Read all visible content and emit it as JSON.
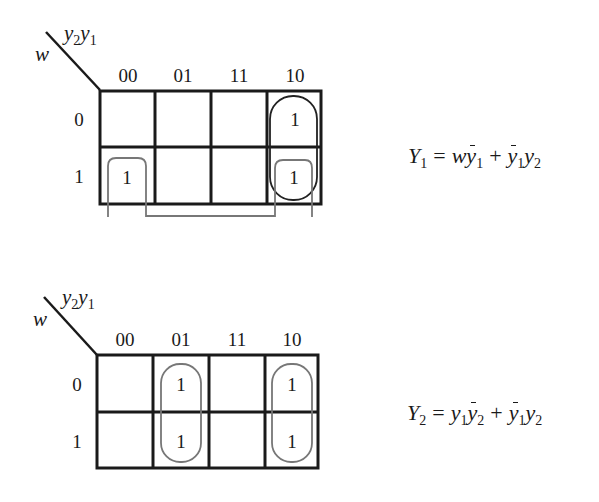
{
  "kmaps": [
    {
      "id": "Y1",
      "col_var_label": "y2y1",
      "row_var_label": "w",
      "col_headers": [
        "00",
        "01",
        "11",
        "10"
      ],
      "row_headers": [
        "0",
        "1"
      ],
      "cells": [
        [
          "",
          "",
          "",
          "1"
        ],
        [
          "1",
          "",
          "",
          "1"
        ]
      ],
      "groups": [
        {
          "name": "w-ybar1 (wraparound: w=1, cols 00 & 10)",
          "color": "#777777"
        },
        {
          "name": "ybar1-y2 (col 10, both rows)",
          "color": "#222222"
        }
      ],
      "equation": {
        "lhs": "Y",
        "lhs_sub": "1",
        "rhs_text": "w ȳ1 + ȳ1 y2",
        "terms": [
          {
            "parts": [
              {
                "v": "w"
              },
              {
                "v": "y",
                "bar": true,
                "sub": "1"
              }
            ]
          },
          {
            "parts": [
              {
                "v": "y",
                "bar": true,
                "sub": "1"
              },
              {
                "v": "y",
                "sub": "2"
              }
            ]
          }
        ]
      }
    },
    {
      "id": "Y2",
      "col_var_label": "y2y1",
      "row_var_label": "w",
      "col_headers": [
        "00",
        "01",
        "11",
        "10"
      ],
      "row_headers": [
        "0",
        "1"
      ],
      "cells": [
        [
          "",
          "1",
          "",
          "1"
        ],
        [
          "",
          "1",
          "",
          "1"
        ]
      ],
      "groups": [
        {
          "name": "y1-ybar2 (col 01, both rows)",
          "color": "#777777"
        },
        {
          "name": "ybar1-y2 (col 10, both rows)",
          "color": "#777777"
        }
      ],
      "equation": {
        "lhs": "Y",
        "lhs_sub": "2",
        "rhs_text": "y1 ȳ2 + ȳ1 y2",
        "terms": [
          {
            "parts": [
              {
                "v": "y",
                "sub": "1"
              },
              {
                "v": "y",
                "bar": true,
                "sub": "2"
              }
            ]
          },
          {
            "parts": [
              {
                "v": "y",
                "bar": true,
                "sub": "1"
              },
              {
                "v": "y",
                "sub": "2"
              }
            ]
          }
        ]
      }
    }
  ],
  "labels": {
    "y": "y",
    "sub1": "1",
    "sub2": "2",
    "w": "w",
    "eq": "=",
    "plus": "+"
  }
}
